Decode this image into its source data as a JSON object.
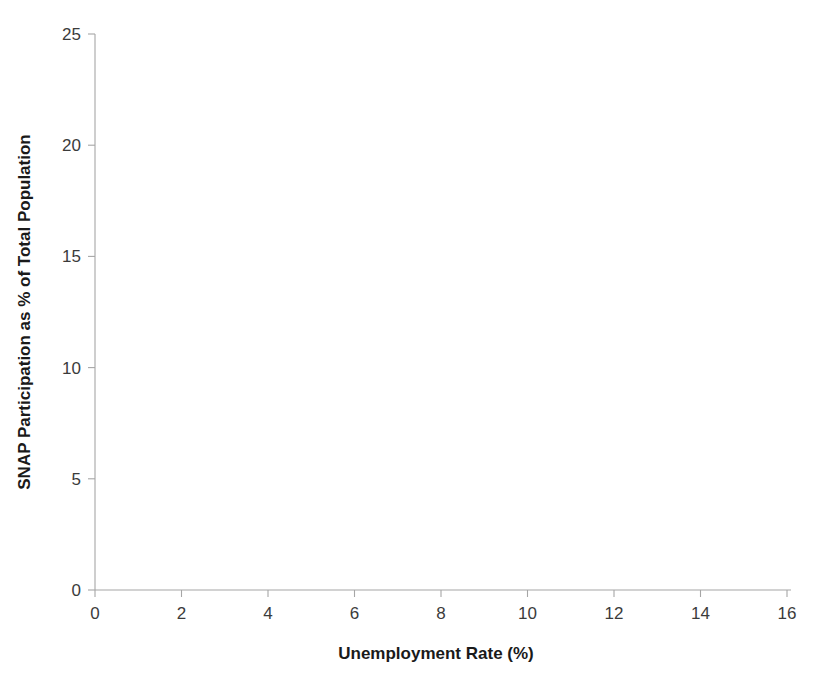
{
  "chart_data": {
    "type": "scatter",
    "title": "",
    "xlabel": "Unemployment Rate (%)",
    "ylabel": "SNAP Participation as % of Total Population",
    "xlim": [
      0,
      16
    ],
    "ylim": [
      0,
      25
    ],
    "xticks": [
      0,
      2,
      4,
      6,
      8,
      10,
      12,
      14,
      16
    ],
    "yticks": [
      0,
      5,
      10,
      15,
      20,
      25
    ],
    "grid": false,
    "legend_position": "upper-left",
    "legend": [
      {
        "label": "2000",
        "marker": "filled-circle"
      },
      {
        "label": "2010",
        "marker": "open-circle"
      }
    ],
    "note": "Bubble size encodes state population; x = unemployment rate (%), y = SNAP participation as % of total population",
    "series": [
      {
        "name": "2000",
        "marker": "filled-circle",
        "points": [
          {
            "x": 2.35,
            "y": 4.8,
            "r": 11
          },
          {
            "x": 2.55,
            "y": 4.35,
            "r": 6
          },
          {
            "x": 2.7,
            "y": 6.1,
            "r": 4
          },
          {
            "x": 2.9,
            "y": 5.05,
            "r": 5
          },
          {
            "x": 3.0,
            "y": 4.1,
            "r": 9
          },
          {
            "x": 3.1,
            "y": 3.55,
            "r": 7
          },
          {
            "x": 3.15,
            "y": 7.55,
            "r": 9
          },
          {
            "x": 3.3,
            "y": 6.95,
            "r": 6
          },
          {
            "x": 3.35,
            "y": 4.6,
            "r": 8
          },
          {
            "x": 3.45,
            "y": 3.9,
            "r": 10
          },
          {
            "x": 3.5,
            "y": 8.85,
            "r": 5
          },
          {
            "x": 3.55,
            "y": 6.35,
            "r": 11
          },
          {
            "x": 3.6,
            "y": 5.45,
            "r": 6
          },
          {
            "x": 3.7,
            "y": 3.45,
            "r": 9
          },
          {
            "x": 3.8,
            "y": 7.05,
            "r": 7
          },
          {
            "x": 3.85,
            "y": 10.15,
            "r": 8
          },
          {
            "x": 3.9,
            "y": 5.9,
            "r": 13
          },
          {
            "x": 4.0,
            "y": 4.25,
            "r": 12
          },
          {
            "x": 4.05,
            "y": 9.35,
            "r": 9
          },
          {
            "x": 4.1,
            "y": 6.6,
            "r": 16
          },
          {
            "x": 4.15,
            "y": 3.0,
            "r": 5
          },
          {
            "x": 4.25,
            "y": 11.3,
            "r": 7
          },
          {
            "x": 4.3,
            "y": 5.35,
            "r": 8
          },
          {
            "x": 4.35,
            "y": 7.9,
            "r": 10
          },
          {
            "x": 4.4,
            "y": 6.15,
            "r": 21
          },
          {
            "x": 4.45,
            "y": 4.05,
            "r": 11
          },
          {
            "x": 4.5,
            "y": 9.05,
            "r": 7
          },
          {
            "x": 4.55,
            "y": 12.55,
            "r": 6
          },
          {
            "x": 4.6,
            "y": 7.35,
            "r": 9
          },
          {
            "x": 4.65,
            "y": 3.25,
            "r": 6
          },
          {
            "x": 4.7,
            "y": 5.65,
            "r": 14
          },
          {
            "x": 4.75,
            "y": 13.55,
            "r": 3
          },
          {
            "x": 4.8,
            "y": 8.15,
            "r": 6
          },
          {
            "x": 4.85,
            "y": 4.7,
            "r": 18
          },
          {
            "x": 4.9,
            "y": 11.9,
            "r": 4
          },
          {
            "x": 5.0,
            "y": 6.85,
            "r": 8
          },
          {
            "x": 5.05,
            "y": 5.2,
            "r": 22
          },
          {
            "x": 5.2,
            "y": 6.4,
            "r": 9
          },
          {
            "x": 5.25,
            "y": 3.7,
            "r": 6
          },
          {
            "x": 5.4,
            "y": 5.95,
            "r": 7
          },
          {
            "x": 2.8,
            "y": 2.95,
            "r": 4
          },
          {
            "x": 3.25,
            "y": 5.75,
            "r": 4
          },
          {
            "x": 4.2,
            "y": 2.8,
            "r": 5
          },
          {
            "x": 5.55,
            "y": 5.5,
            "r": 4
          },
          {
            "x": 3.05,
            "y": 6.5,
            "r": 3
          }
        ]
      },
      {
        "name": "2010",
        "marker": "open-circle",
        "points": [
          {
            "x": 2.45,
            "y": 5.25,
            "r": 7
          },
          {
            "x": 2.6,
            "y": 7.15,
            "r": 8
          },
          {
            "x": 2.95,
            "y": 4.95,
            "r": 6
          },
          {
            "x": 3.2,
            "y": 8.4,
            "r": 9
          },
          {
            "x": 3.4,
            "y": 6.05,
            "r": 7
          },
          {
            "x": 3.75,
            "y": 4.55,
            "r": 8
          },
          {
            "x": 4.05,
            "y": 10.8,
            "r": 7
          },
          {
            "x": 4.45,
            "y": 9.0,
            "r": 10
          },
          {
            "x": 4.6,
            "y": 5.1,
            "r": 9
          },
          {
            "x": 4.95,
            "y": 6.55,
            "r": 12
          },
          {
            "x": 5.15,
            "y": 7.8,
            "r": 8
          },
          {
            "x": 5.5,
            "y": 4.4,
            "r": 7
          },
          {
            "x": 5.7,
            "y": 13.1,
            "r": 6
          },
          {
            "x": 5.95,
            "y": 15.85,
            "r": 7
          },
          {
            "x": 6.1,
            "y": 18.5,
            "r": 7
          },
          {
            "x": 6.05,
            "y": 11.15,
            "r": 8
          },
          {
            "x": 6.25,
            "y": 8.05,
            "r": 7
          },
          {
            "x": 6.35,
            "y": 5.9,
            "r": 5
          },
          {
            "x": 6.5,
            "y": 10.05,
            "r": 9
          },
          {
            "x": 6.7,
            "y": 9.75,
            "r": 10
          },
          {
            "x": 6.95,
            "y": 15.4,
            "r": 9
          },
          {
            "x": 7.05,
            "y": 9.85,
            "r": 9
          },
          {
            "x": 7.2,
            "y": 18.05,
            "r": 10
          },
          {
            "x": 7.35,
            "y": 12.35,
            "r": 7
          },
          {
            "x": 7.45,
            "y": 8.2,
            "r": 9
          },
          {
            "x": 7.65,
            "y": 16.05,
            "r": 8
          },
          {
            "x": 7.8,
            "y": 17.25,
            "r": 7
          },
          {
            "x": 7.95,
            "y": 17.3,
            "r": 7
          },
          {
            "x": 8.05,
            "y": 12.45,
            "r": 12
          },
          {
            "x": 8.15,
            "y": 14.95,
            "r": 10
          },
          {
            "x": 8.2,
            "y": 11.05,
            "r": 6
          },
          {
            "x": 8.45,
            "y": 12.3,
            "r": 8
          },
          {
            "x": 8.6,
            "y": 13.95,
            "r": 13
          },
          {
            "x": 8.75,
            "y": 12.25,
            "r": 5
          },
          {
            "x": 8.95,
            "y": 14.25,
            "r": 12
          },
          {
            "x": 9.0,
            "y": 9.45,
            "r": 7
          },
          {
            "x": 9.3,
            "y": 13.45,
            "r": 14
          },
          {
            "x": 9.45,
            "y": 7.15,
            "r": 9
          },
          {
            "x": 9.55,
            "y": 8.05,
            "r": 8
          },
          {
            "x": 9.7,
            "y": 16.55,
            "r": 13
          },
          {
            "x": 9.85,
            "y": 19.35,
            "r": 10
          },
          {
            "x": 9.9,
            "y": 14.35,
            "r": 15
          },
          {
            "x": 10.05,
            "y": 17.85,
            "r": 9
          },
          {
            "x": 10.25,
            "y": 19.5,
            "r": 8
          },
          {
            "x": 10.35,
            "y": 16.35,
            "r": 11
          },
          {
            "x": 10.45,
            "y": 18.35,
            "r": 9
          },
          {
            "x": 10.55,
            "y": 14.15,
            "r": 14
          },
          {
            "x": 10.7,
            "y": 12.9,
            "r": 11
          },
          {
            "x": 11.0,
            "y": 14.25,
            "r": 13
          },
          {
            "x": 11.25,
            "y": 17.25,
            "r": 8
          },
          {
            "x": 11.4,
            "y": 13.15,
            "r": 4
          },
          {
            "x": 13.1,
            "y": 18.05,
            "r": 14
          },
          {
            "x": 14.65,
            "y": 10.35,
            "r": 6
          },
          {
            "x": 6.15,
            "y": 6.5,
            "r": 4
          },
          {
            "x": 7.55,
            "y": 13.7,
            "r": 4
          }
        ]
      }
    ],
    "annotations": [
      {
        "label": "TX",
        "bubble": {
          "x": 8.05,
          "y": 14.2,
          "r": 27
        },
        "arrow_from": {
          "x": 4.95,
          "y": 7.55
        },
        "arrow_to": {
          "x": 7.6,
          "y": 13.35
        }
      },
      {
        "label": "NY",
        "bubble": {
          "x": 8.7,
          "y": 14.2,
          "r": 26
        },
        "arrow_from": {
          "x": 4.95,
          "y": 7.55
        },
        "arrow_to": {
          "x": 8.2,
          "y": 13.4
        }
      },
      {
        "label": "CA",
        "bubble": {
          "x": 12.35,
          "y": 8.85,
          "r": 27
        },
        "arrow_from": {
          "x": 5.55,
          "y": 5.65
        },
        "arrow_to": {
          "x": 11.75,
          "y": 8.95
        }
      }
    ]
  }
}
